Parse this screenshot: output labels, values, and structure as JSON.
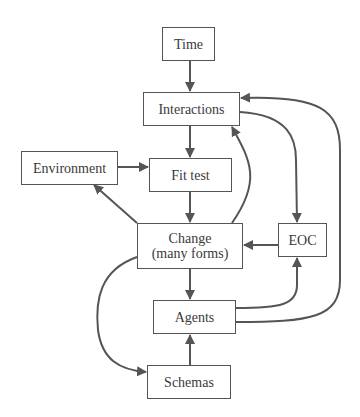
{
  "diagram": {
    "type": "flowchart",
    "colors": {
      "stroke": "#555555",
      "text": "#3a3a3a",
      "background": "#ffffff"
    },
    "nodes": {
      "time": {
        "label": "Time"
      },
      "interactions": {
        "label": "Interactions"
      },
      "environment": {
        "label": "Environment"
      },
      "fit_test": {
        "label": "Fit test"
      },
      "change": {
        "label_line1": "Change",
        "label_line2": "(many forms)"
      },
      "eoc": {
        "label": "EOC"
      },
      "agents": {
        "label": "Agents"
      },
      "schemas": {
        "label": "Schemas"
      }
    },
    "edges": [
      {
        "from": "Time",
        "to": "Interactions"
      },
      {
        "from": "Interactions",
        "to": "Fit test"
      },
      {
        "from": "Interactions",
        "to": "EOC"
      },
      {
        "from": "Environment",
        "to": "Fit test"
      },
      {
        "from": "Fit test",
        "to": "Change (many forms)"
      },
      {
        "from": "Change (many forms)",
        "to": "Environment"
      },
      {
        "from": "Change (many forms)",
        "to": "Interactions"
      },
      {
        "from": "Change (many forms)",
        "to": "Agents"
      },
      {
        "from": "Change (many forms)",
        "to": "Schemas"
      },
      {
        "from": "EOC",
        "to": "Change (many forms)"
      },
      {
        "from": "Agents",
        "to": "EOC"
      },
      {
        "from": "Agents",
        "to": "Interactions"
      },
      {
        "from": "Schemas",
        "to": "Agents"
      }
    ]
  }
}
